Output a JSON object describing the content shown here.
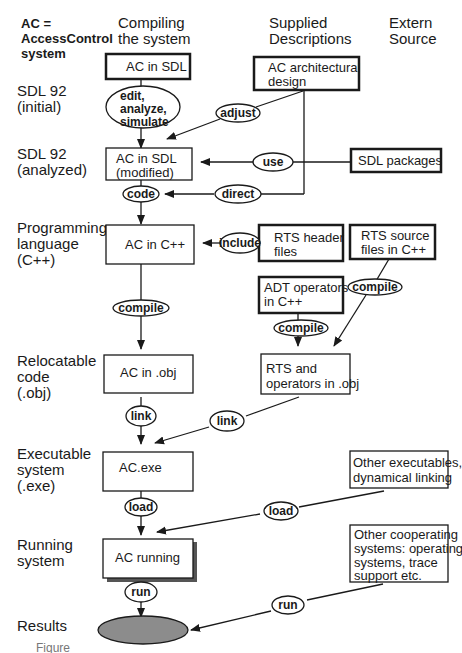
{
  "legend": {
    "line1": "AC =",
    "line2": "AccessControl",
    "line3": "system"
  },
  "columns": {
    "compiling": {
      "line1": "Compiling",
      "line2": "the system"
    },
    "supplied": {
      "line1": "Supplied",
      "line2": "Descriptions"
    },
    "extern": {
      "line1": "Extern",
      "line2": "Source"
    }
  },
  "rows": {
    "sdl_initial": {
      "line1": "SDL 92",
      "line2": "(initial)"
    },
    "sdl_analyzed": {
      "line1": "SDL 92",
      "line2": "(analyzed)"
    },
    "programming": {
      "line1": "Programming",
      "line2": "language",
      "line3": "(C++)"
    },
    "relocatable": {
      "line1": "Relocatable",
      "line2": "code",
      "line3": "(.obj)"
    },
    "executable": {
      "line1": "Executable",
      "line2": "system",
      "line3": "(.exe)"
    },
    "running": {
      "line1": "Running",
      "line2": "system"
    },
    "results": {
      "line1": "Results"
    }
  },
  "boxes": {
    "ac_sdl": {
      "line1": "AC in SDL"
    },
    "ac_arch": {
      "line1": "AC architectural",
      "line2": "design"
    },
    "ac_sdl_mod": {
      "line1": "AC in SDL",
      "line2": "(modified)"
    },
    "sdl_packages": {
      "line1": "SDL packages"
    },
    "ac_cpp": {
      "line1": "AC in C++"
    },
    "rts_header": {
      "line1": "RTS header",
      "line2": "files"
    },
    "rts_source": {
      "line1": "RTS source",
      "line2": "files in C++"
    },
    "adt_ops": {
      "line1": "ADT operators",
      "line2": "in C++"
    },
    "ac_obj": {
      "line1": "AC in .obj"
    },
    "rts_obj": {
      "line1": "RTS and",
      "line2": "operators in .obj"
    },
    "ac_exe": {
      "line1": "AC.exe"
    },
    "other_exe": {
      "line1": "Other executables,",
      "line2": "dynamical linking"
    },
    "ac_running": {
      "line1": "AC running"
    },
    "other_coop": {
      "line1": "Other cooperating",
      "line2": "systems: operating",
      "line3": "systems, trace",
      "line4": "support etc."
    }
  },
  "operations": {
    "edit": {
      "line1": "edit,",
      "line2": "analyze,",
      "line3": "simulate"
    },
    "adjust": "adjust",
    "use": "use",
    "code": "code",
    "direct": "direct",
    "include": "include",
    "compile_ac": "compile",
    "compile_adt": "compile",
    "compile_rts": "compile",
    "link_ac": "link",
    "link_rts": "link",
    "load_ac": "load",
    "load_other": "load",
    "run_ac": "run",
    "run_other": "run"
  },
  "caption": "Figure"
}
